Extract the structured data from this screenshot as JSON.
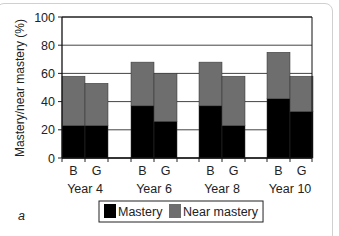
{
  "chart_data": {
    "type": "bar",
    "stacked": true,
    "title": "",
    "panel_label": "a",
    "xlabel": "",
    "ylabel": "Mastery/near mastery (%)",
    "ylim": [
      0,
      100
    ],
    "yticks": [
      0,
      20,
      40,
      60,
      80,
      100
    ],
    "grid": true,
    "groups": [
      "Year 4",
      "Year 6",
      "Year 8",
      "Year 10"
    ],
    "categories": [
      "B",
      "G",
      "B",
      "G",
      "B",
      "G",
      "B",
      "G"
    ],
    "series": [
      {
        "name": "Mastery",
        "color": "#000000",
        "values": [
          23,
          23,
          37,
          26,
          37,
          23,
          42,
          33
        ]
      },
      {
        "name": "Near mastery",
        "color": "#6e6e6e",
        "values": [
          35,
          30,
          31,
          34,
          31,
          35,
          33,
          25
        ]
      }
    ],
    "totals": [
      58,
      53,
      68,
      60,
      68,
      58,
      75,
      58
    ],
    "legend": {
      "position": "bottom",
      "entries": [
        "Mastery",
        "Near mastery"
      ]
    }
  }
}
